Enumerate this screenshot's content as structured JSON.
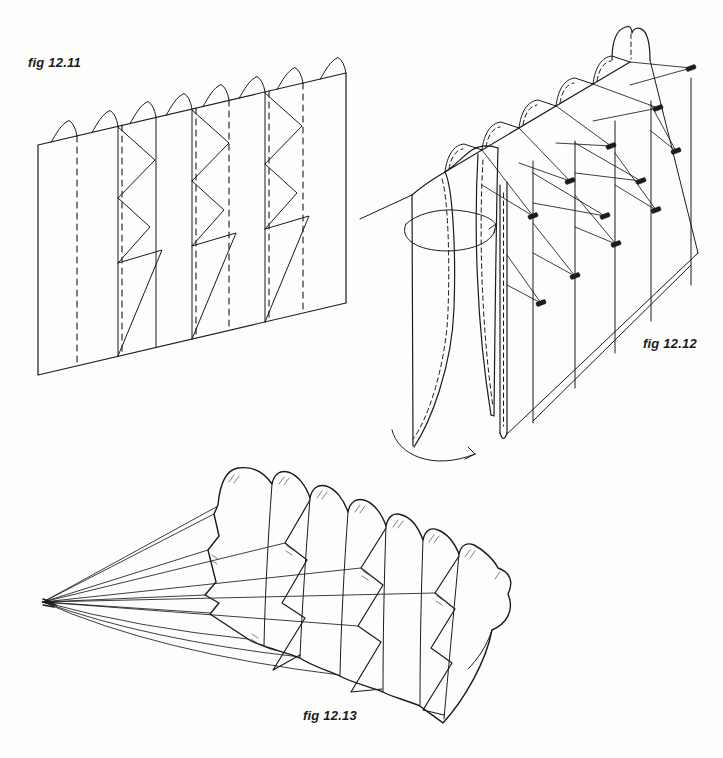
{
  "page": {
    "background": "#fdfdfc",
    "ink": "#1b1b1b",
    "description_visible_text_only": true
  },
  "figures": [
    {
      "id": "fig-12-11",
      "label": "fig 12.11"
    },
    {
      "id": "fig-12-12",
      "label": "fig 12.12"
    },
    {
      "id": "fig-12-13",
      "label": "fig 12.13"
    }
  ]
}
